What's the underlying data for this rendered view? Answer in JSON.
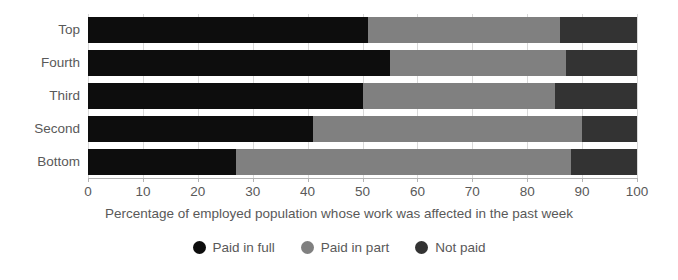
{
  "chart_data": {
    "type": "bar",
    "orientation": "horizontal",
    "stacked": true,
    "stack_mode": "percent",
    "title": "",
    "subtitle": "",
    "xlabel": "Percentage of employed population whose work was affected in the past week",
    "ylabel": "",
    "categories": [
      "Top",
      "Fourth",
      "Third",
      "Second",
      "Bottom"
    ],
    "series": [
      {
        "name": "Paid in full",
        "color": "#0d0d0d",
        "values": [
          51,
          55,
          50,
          41,
          27
        ]
      },
      {
        "name": "Paid in part",
        "color": "#808080",
        "values": [
          35,
          32,
          35,
          49,
          61
        ]
      },
      {
        "name": "Not paid",
        "color": "#333333",
        "values": [
          14,
          13,
          15,
          10,
          12
        ]
      }
    ],
    "xlim": [
      0,
      100
    ],
    "xticks": [
      0,
      10,
      20,
      30,
      40,
      50,
      60,
      70,
      80,
      90,
      100
    ],
    "xtick_labels": [
      "0",
      "10",
      "20",
      "30",
      "40",
      "50",
      "60",
      "70",
      "80",
      "90",
      "100"
    ],
    "grid": true,
    "grid_axis": "x",
    "legend_position": "bottom",
    "legend": [
      "Paid in full",
      "Paid in part",
      "Not paid"
    ],
    "annotations": []
  },
  "style": {
    "background": "#ffffff",
    "text_color": "#595959",
    "axis_color": "#b3b3b3",
    "grid_color": "#d9d9d9"
  }
}
